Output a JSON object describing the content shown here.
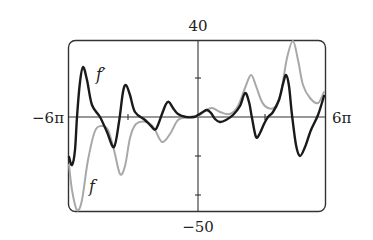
{
  "chart_data": {
    "type": "line",
    "title": "",
    "xlabel": "",
    "ylabel": "",
    "xlim_label": [
      "-6π",
      "6π"
    ],
    "ylim": [
      -50,
      40
    ],
    "y_top_label": "40",
    "y_bottom_label": "-50",
    "x_left_label": "−6π",
    "x_right_label": "6π",
    "grid": false,
    "y_ticks": [
      20,
      0,
      -20,
      -40
    ],
    "x_ticks_approx": [
      -10,
      10
    ],
    "series": [
      {
        "name": "f",
        "label": "f",
        "color": "#a8a8a8",
        "description": "Gray curve; deep min near left edge (~-50), oscillations growing to a peak near 40 at right",
        "points_px": [
          [
            69,
            165
          ],
          [
            72,
            190
          ],
          [
            77,
            210
          ],
          [
            82,
            200
          ],
          [
            88,
            160
          ],
          [
            95,
            131
          ],
          [
            102,
            126
          ],
          [
            108,
            130
          ],
          [
            114,
            150
          ],
          [
            120,
            174
          ],
          [
            125,
            166
          ],
          [
            130,
            138
          ],
          [
            136,
            124
          ],
          [
            147,
            122
          ],
          [
            154,
            128
          ],
          [
            162,
            142
          ],
          [
            170,
            134
          ],
          [
            178,
            120
          ],
          [
            188,
            117
          ],
          [
            198,
            116
          ],
          [
            205,
            111
          ],
          [
            212,
            108
          ],
          [
            220,
            112
          ],
          [
            230,
            114
          ],
          [
            238,
            106
          ],
          [
            245,
            88
          ],
          [
            251,
            75
          ],
          [
            256,
            86
          ],
          [
            262,
            102
          ],
          [
            268,
            108
          ],
          [
            275,
            107
          ],
          [
            281,
            92
          ],
          [
            287,
            58
          ],
          [
            293,
            41
          ],
          [
            298,
            60
          ],
          [
            303,
            85
          ],
          [
            310,
            98
          ],
          [
            318,
            103
          ],
          [
            324,
            92
          ]
        ]
      },
      {
        "name": "f'",
        "label": "f′",
        "color": "#1a1a1a",
        "description": "Black derivative curve oscillating about the x-axis with growing amplitude at both ends",
        "points_px": [
          [
            69,
            157
          ],
          [
            72,
            165
          ],
          [
            75,
            150
          ],
          [
            77,
            117
          ],
          [
            80,
            82
          ],
          [
            83,
            67
          ],
          [
            87,
            80
          ],
          [
            92,
            105
          ],
          [
            100,
            117
          ],
          [
            107,
            132
          ],
          [
            114,
            147
          ],
          [
            119,
            122
          ],
          [
            123,
            92
          ],
          [
            126,
            85
          ],
          [
            130,
            95
          ],
          [
            135,
            112
          ],
          [
            145,
            120
          ],
          [
            151,
            126
          ],
          [
            156,
            129
          ],
          [
            162,
            114
          ],
          [
            166,
            104
          ],
          [
            169,
            102
          ],
          [
            173,
            108
          ],
          [
            178,
            114
          ],
          [
            186,
            117
          ],
          [
            194,
            117
          ],
          [
            198,
            115
          ],
          [
            203,
            112
          ],
          [
            207,
            110
          ],
          [
            211,
            113
          ],
          [
            215,
            119
          ],
          [
            220,
            122
          ],
          [
            226,
            120
          ],
          [
            233,
            115
          ],
          [
            240,
            106
          ],
          [
            245,
            93
          ],
          [
            249,
            102
          ],
          [
            252,
            118
          ],
          [
            256,
            137
          ],
          [
            260,
            133
          ],
          [
            264,
            124
          ],
          [
            268,
            117
          ],
          [
            273,
            112
          ],
          [
            279,
            100
          ],
          [
            283,
            84
          ],
          [
            286,
            75
          ],
          [
            289,
            86
          ],
          [
            292,
            115
          ],
          [
            296,
            145
          ],
          [
            300,
            156
          ],
          [
            305,
            147
          ],
          [
            311,
            130
          ],
          [
            318,
            115
          ],
          [
            324,
            96
          ]
        ]
      }
    ],
    "annotations": [
      {
        "text": "f′",
        "near_series": "f'"
      },
      {
        "text": "f",
        "near_series": "f"
      }
    ],
    "legend": "none (inline curve labels)"
  },
  "labels": {
    "y_top": "40",
    "y_bottom": "−50",
    "x_left": "−6π",
    "x_right": "6π",
    "f_prime": "f′",
    "f": "f"
  }
}
